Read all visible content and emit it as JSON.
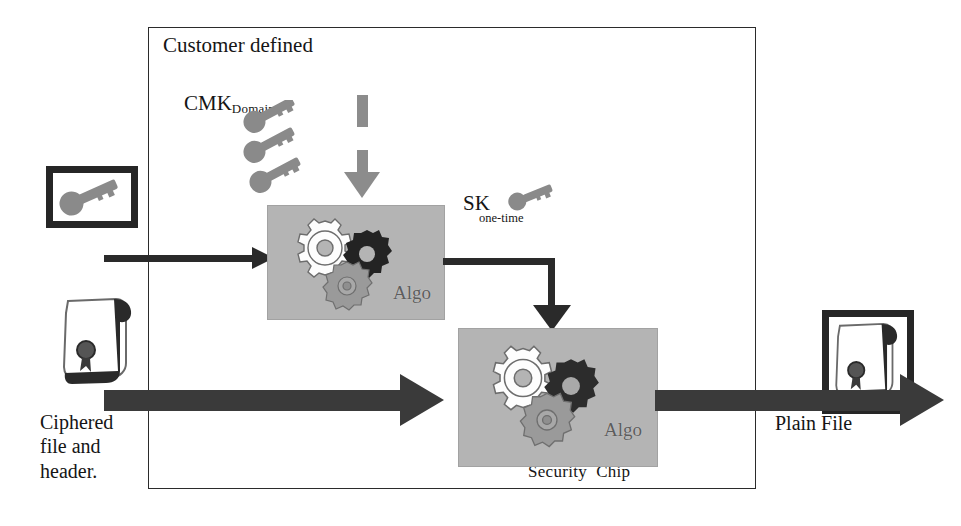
{
  "diagram": {
    "title_lines": {
      "customer_defined": "Customer defined",
      "cmk_main": "CMK",
      "cmk_sub": "Domain"
    },
    "sk_label": {
      "main": "SK",
      "sub": "one-time"
    },
    "algo_box_1": {
      "label": "Algo"
    },
    "algo_box_2": {
      "label": "Algo"
    },
    "security_chip_label": "Security  Chip",
    "ciphered_label": "Ciphered\nfile and\nheader.",
    "plain_file_label": "Plain File",
    "icons": {
      "key_framed": "key-icon",
      "scroll_left": "sealed-scroll-icon",
      "scroll_framed_right": "sealed-scroll-icon",
      "sk_key": "key-icon",
      "cmk_keys": "key-icon",
      "gear_white": "gear-icon",
      "gear_dark": "gear-icon",
      "gear_gray": "gear-icon"
    },
    "colors": {
      "algo_box_fill": "#b4b4b4",
      "arrow_dark": "#3a3a3a",
      "arrow_thin": "#2a2a2a",
      "cmk_arrow_gray": "#8c8c8c",
      "frame_border": "#262626",
      "key_gray": "#8a8a8a",
      "gear_dark": "#232323",
      "gear_white": "#fdfdfd",
      "gear_gray": "#9a9a9a",
      "outer_border": "#2b2b2b",
      "text": "#151515",
      "algo_text": "#5d5d5d"
    }
  }
}
